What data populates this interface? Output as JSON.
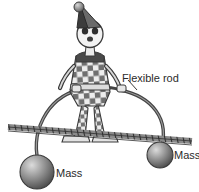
{
  "figure": {
    "background_color": "#ffffff",
    "ink_color": "#2b2b2b"
  },
  "labels": {
    "flexible_rod": "Flexible rod",
    "mass_left": "Mass",
    "mass_right": "Mass"
  },
  "elements": {
    "rope_name": "tightrope",
    "rod_name": "flexible-rod",
    "left_mass_name": "left-mass-sphere",
    "right_mass_name": "right-mass-sphere",
    "clown_name": "clown-figure",
    "hat_name": "clown-hat",
    "pompom_name": "hat-pompom",
    "face_name": "clown-face"
  },
  "colors": {
    "line": "#3a3a3a",
    "rope": "#4a4a4a",
    "costume_dark": "#6e6e6e",
    "costume_light": "#e8e8e8",
    "sphere_light": "#cfcfcf",
    "sphere_dark": "#4d4d4d",
    "hat_dark": "#3c3c3c",
    "face_light": "#f2f2f2"
  }
}
